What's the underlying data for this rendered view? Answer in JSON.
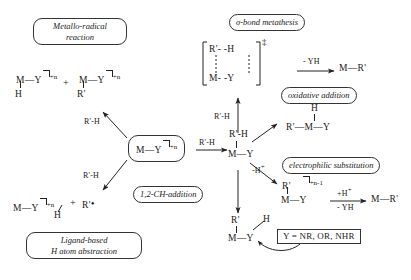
{
  "diagram": {
    "title_text": "Reaction pathways of metal-ligand complexes with R'-H",
    "labels": {
      "metallo_radical": "Metallo-radical\nreaction",
      "metallo_radical_l1": "Metallo-radical",
      "metallo_radical_l2": "reaction",
      "ligand_based_l1": "Ligand-based",
      "ligand_based_l2": "H atom abstraction",
      "sigma_bond_metathesis": "σ-bond metathesis",
      "oxidative_addition": "oxidative addition",
      "electrophilic_substitution": "electrophilic substitution",
      "ch_addition": "1,2-CH-addition",
      "y_definition": "Y = NR, OR, NHR"
    },
    "core": {
      "metal": "M",
      "bond": "—",
      "ligand": "Y",
      "charge": "+n"
    },
    "reagents": {
      "rh_top_left": "R'-H",
      "rh_bottom_left": "R'-H",
      "rh_center": "R'-H",
      "rh_sigma": "R'-H",
      "minus_yh": "- YH",
      "minus_h_plus": "-H",
      "minus_h_plus_sup": "+",
      "plus_h_plus": "+H",
      "plus_h_plus_sup": "+",
      "minus_yh_2": "- YH"
    },
    "products": {
      "metallo_radical_a": {
        "metal": "M",
        "ligand": "Y",
        "below": "H",
        "charge": "+n"
      },
      "metallo_radical_b": {
        "metal": "M",
        "ligand": "Y",
        "below": "R'",
        "charge": "+n"
      },
      "plus_sign": "+",
      "ligand_based": {
        "metal": "M",
        "ligand": "Y",
        "below": "H",
        "charge": "+n",
        "radical": "R'",
        "dot": "•",
        "plus": "+"
      },
      "sigma_ts": {
        "top_left": "R'",
        "top_dash": "- -",
        "top_right": "H",
        "bottom_left": "M",
        "bottom_dash": "- -",
        "bottom_right": "Y",
        "dagger": "‡"
      },
      "sigma_product": {
        "metal": "M",
        "bond": "—",
        "group": "R'"
      },
      "oxidative_addition_product": {
        "top": "H",
        "left": "R'",
        "metal": "M",
        "ligand": "Y"
      },
      "center_intermediate": {
        "top": "R'-H",
        "metal": "M",
        "ligand": "Y"
      },
      "electrophilic_intermediate": {
        "top": "R'",
        "metal": "M",
        "ligand": "Y",
        "charge": "+n-1"
      },
      "electrophilic_product": {
        "metal": "M",
        "bond": "—",
        "group": "R'"
      },
      "ch_addition_product": {
        "top": "R'",
        "metal": "M",
        "ligand": "Y",
        "h": "H"
      }
    },
    "colors": {
      "stroke": "#333333",
      "text": "#1a1a1a",
      "background": "#ffffff"
    }
  }
}
